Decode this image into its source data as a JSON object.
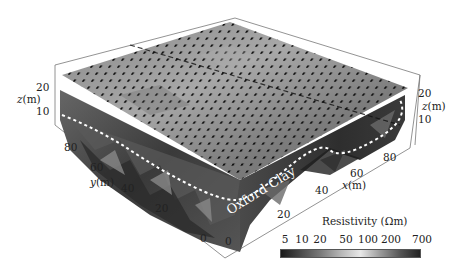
{
  "figure": {
    "type": "3D resistivity volume (ERT model)",
    "annotation": "Oxford Clay",
    "axes": {
      "x": {
        "label_var": "x",
        "label_unit": "(m)",
        "ticks": [
          "0",
          "20",
          "40",
          "60",
          "80"
        ]
      },
      "y": {
        "label_var": "y",
        "label_unit": "(m)",
        "ticks": [
          "0",
          "20",
          "40",
          "60",
          "80"
        ]
      },
      "z_left": {
        "label_var": "z",
        "label_unit": "(m)",
        "ticks": [
          "10",
          "20"
        ]
      },
      "z_right": {
        "label_var": "z",
        "label_unit": "(m)",
        "ticks": [
          "10",
          "20"
        ]
      }
    },
    "colorbar": {
      "title": "Resistivity (Ωm)",
      "ticks": [
        "5",
        "10",
        "20",
        "50",
        "100",
        "200",
        "700"
      ],
      "colors": [
        "#1a1a1a",
        "#4a4a4a",
        "#7a7a7a",
        "#b5b5b5",
        "#e8e8e8",
        "#9a9a9a",
        "#555555",
        "#222222"
      ]
    }
  }
}
